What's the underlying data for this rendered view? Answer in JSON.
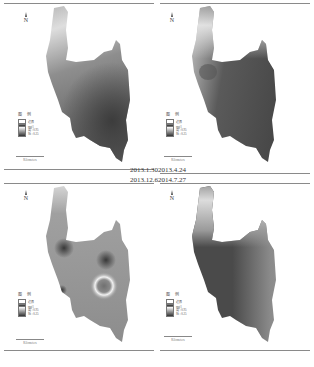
{
  "figure": {
    "panels": [
      {
        "id": "p1",
        "date": "2013.1.30",
        "legend": {
          "title": "图 例",
          "items": [
            "边界",
            "mg/l",
            "高 : 0.95",
            "低 : 0.25"
          ]
        },
        "scale_label": "Kilometers",
        "north": "N"
      },
      {
        "id": "p2",
        "date": "2013.4.24",
        "legend": {
          "title": "图 例",
          "items": [
            "边界",
            "mg/l",
            "高 : 0.95",
            "低 : 0.25"
          ]
        },
        "scale_label": "Kilometers",
        "north": "N"
      },
      {
        "id": "p3",
        "date": "2013.12.6",
        "legend": {
          "title": "图 例",
          "items": [
            "边界",
            "mg/l",
            "高 : 0.95",
            "低 : 0.25"
          ]
        },
        "scale_label": "Kilometers",
        "north": "N"
      },
      {
        "id": "p4",
        "date": "2014.7.27",
        "legend": {
          "title": "图 例",
          "items": [
            "边界",
            "mg/l",
            "高 : 0.95",
            "低 : 0.25"
          ]
        },
        "scale_label": "Kilometers",
        "north": "N"
      }
    ],
    "colors": {
      "light": "#e6e6e6",
      "mid": "#9a9a9a",
      "dark": "#4a4a4a",
      "line": "#8a8a8a"
    }
  }
}
